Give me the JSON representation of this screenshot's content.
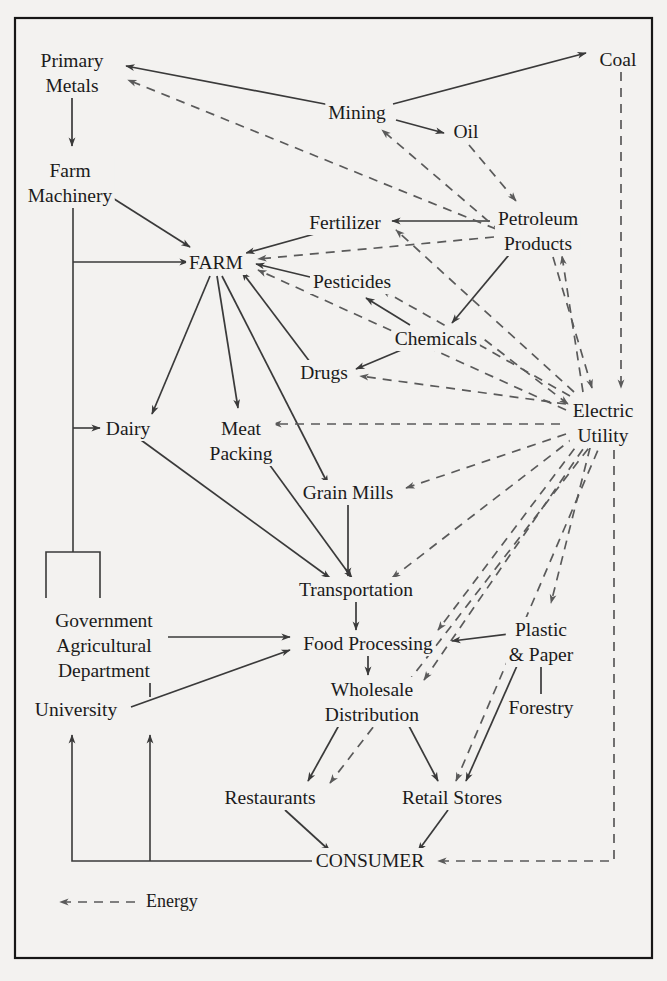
{
  "diagram": {
    "legend": {
      "label": "Energy",
      "style": "dashed-arrow"
    },
    "colors": {
      "background": "#f3f2f0",
      "ink": "#1b1b1b",
      "solid_line": "#3a3a3a",
      "dashed_line": "#5a5a5a",
      "frame": "#171717"
    },
    "nodes": [
      {
        "id": "primary_metals",
        "label_lines": [
          "Primary",
          "Metals"
        ],
        "x": 72,
        "y": 60
      },
      {
        "id": "coal",
        "label_lines": [
          "Coal"
        ],
        "x": 618,
        "y": 59
      },
      {
        "id": "mining",
        "label_lines": [
          "Mining"
        ],
        "x": 357,
        "y": 112
      },
      {
        "id": "oil",
        "label_lines": [
          "Oil"
        ],
        "x": 466,
        "y": 131
      },
      {
        "id": "farm_machinery",
        "label_lines": [
          "Farm",
          "Machinery"
        ],
        "x": 70,
        "y": 170
      },
      {
        "id": "fertilizer",
        "label_lines": [
          "Fertilizer"
        ],
        "x": 345,
        "y": 222
      },
      {
        "id": "petroleum_products",
        "label_lines": [
          "Petroleum",
          "Products"
        ],
        "x": 538,
        "y": 218
      },
      {
        "id": "farm",
        "label_lines": [
          "FARM"
        ],
        "x": 216,
        "y": 262
      },
      {
        "id": "pesticides",
        "label_lines": [
          "Pesticides"
        ],
        "x": 352,
        "y": 281
      },
      {
        "id": "chemicals",
        "label_lines": [
          "Chemicals"
        ],
        "x": 436,
        "y": 338
      },
      {
        "id": "drugs",
        "label_lines": [
          "Drugs"
        ],
        "x": 324,
        "y": 372
      },
      {
        "id": "electric_utility",
        "label_lines": [
          "Electric",
          "Utility"
        ],
        "x": 603,
        "y": 410
      },
      {
        "id": "dairy",
        "label_lines": [
          "Dairy"
        ],
        "x": 128,
        "y": 428
      },
      {
        "id": "meat_packing",
        "label_lines": [
          "Meat",
          "Packing"
        ],
        "x": 241,
        "y": 428
      },
      {
        "id": "grain_mills",
        "label_lines": [
          "Grain Mills"
        ],
        "x": 348,
        "y": 492
      },
      {
        "id": "transportation",
        "label_lines": [
          "Transportation"
        ],
        "x": 356,
        "y": 589
      },
      {
        "id": "government_ag_dept",
        "label_lines": [
          "Government",
          "Agricultural",
          "Department"
        ],
        "x": 104,
        "y": 620
      },
      {
        "id": "food_processing",
        "label_lines": [
          "Food Processing"
        ],
        "x": 368,
        "y": 643
      },
      {
        "id": "plastic_paper",
        "label_lines": [
          "Plastic",
          "& Paper"
        ],
        "x": 541,
        "y": 629
      },
      {
        "id": "forestry",
        "label_lines": [
          "Forestry"
        ],
        "x": 541,
        "y": 707
      },
      {
        "id": "university",
        "label_lines": [
          "University"
        ],
        "x": 76,
        "y": 709
      },
      {
        "id": "wholesale_distribution",
        "label_lines": [
          "Wholesale",
          "Distribution"
        ],
        "x": 372,
        "y": 689
      },
      {
        "id": "restaurants",
        "label_lines": [
          "Restaurants"
        ],
        "x": 270,
        "y": 797
      },
      {
        "id": "retail_stores",
        "label_lines": [
          "Retail Stores"
        ],
        "x": 452,
        "y": 797
      },
      {
        "id": "consumer",
        "label_lines": [
          "CONSUMER"
        ],
        "x": 370,
        "y": 860
      }
    ],
    "material_flows": [
      {
        "from": "mining",
        "to": "primary_metals"
      },
      {
        "from": "mining",
        "to": "coal"
      },
      {
        "from": "mining",
        "to": "oil"
      },
      {
        "from": "primary_metals",
        "to": "farm_machinery"
      },
      {
        "from": "farm_machinery",
        "to": "farm"
      },
      {
        "from": "petroleum_products",
        "to": "fertilizer"
      },
      {
        "from": "fertilizer",
        "to": "farm"
      },
      {
        "from": "pesticides",
        "to": "farm"
      },
      {
        "from": "chemicals",
        "to": "pesticides"
      },
      {
        "from": "chemicals",
        "to": "drugs"
      },
      {
        "from": "petroleum_products",
        "to": "chemicals"
      },
      {
        "from": "drugs",
        "to": "farm"
      },
      {
        "from": "farm",
        "to": "dairy"
      },
      {
        "from": "farm",
        "to": "meat_packing"
      },
      {
        "from": "farm",
        "to": "grain_mills"
      },
      {
        "from": "dairy",
        "to": "transportation"
      },
      {
        "from": "meat_packing",
        "to": "transportation"
      },
      {
        "from": "grain_mills",
        "to": "transportation"
      },
      {
        "from": "transportation",
        "to": "food_processing"
      },
      {
        "from": "government_ag_dept",
        "to": "food_processing"
      },
      {
        "from": "university",
        "to": "food_processing"
      },
      {
        "from": "university",
        "to": "government_ag_dept"
      },
      {
        "from": "plastic_paper",
        "to": "food_processing"
      },
      {
        "from": "forestry",
        "to": "plastic_paper"
      },
      {
        "from": "food_processing",
        "to": "wholesale_distribution"
      },
      {
        "from": "wholesale_distribution",
        "to": "restaurants"
      },
      {
        "from": "wholesale_distribution",
        "to": "retail_stores"
      },
      {
        "from": "plastic_paper",
        "to": "retail_stores"
      },
      {
        "from": "restaurants",
        "to": "consumer"
      },
      {
        "from": "retail_stores",
        "to": "consumer"
      },
      {
        "from": "consumer",
        "to": "university"
      },
      {
        "from": "consumer",
        "to": "government_ag_dept"
      },
      {
        "from": "bracket",
        "to": "farm"
      },
      {
        "from": "bracket",
        "to": "dairy"
      },
      {
        "from": "bracket",
        "to": "farm_machinery"
      }
    ],
    "energy_flows": [
      {
        "from": "petroleum_products",
        "to": "primary_metals"
      },
      {
        "from": "petroleum_products",
        "to": "mining"
      },
      {
        "from": "oil",
        "to": "petroleum_products"
      },
      {
        "from": "petroleum_products",
        "to": "farm"
      },
      {
        "from": "electric_utility",
        "to": "fertilizer_area"
      },
      {
        "from": "electric_utility",
        "to": "pesticides"
      },
      {
        "from": "electric_utility",
        "to": "drugs"
      },
      {
        "from": "electric_utility",
        "to": "farm"
      },
      {
        "from": "coal",
        "to": "electric_utility"
      },
      {
        "from": "petroleum_products",
        "to": "electric_utility"
      },
      {
        "from": "electric_utility",
        "to": "petroleum_products"
      },
      {
        "from": "chemicals",
        "to": "electric_utility"
      },
      {
        "from": "electric_utility",
        "to": "meat_packing"
      },
      {
        "from": "electric_utility",
        "to": "dairy"
      },
      {
        "from": "electric_utility",
        "to": "grain_mills"
      },
      {
        "from": "electric_utility",
        "to": "transportation"
      },
      {
        "from": "electric_utility",
        "to": "food_processing"
      },
      {
        "from": "electric_utility",
        "to": "wholesale_distribution"
      },
      {
        "from": "electric_utility",
        "to": "restaurants"
      },
      {
        "from": "electric_utility",
        "to": "retail_stores"
      },
      {
        "from": "electric_utility",
        "to": "plastic_paper"
      },
      {
        "from": "electric_utility",
        "to": "consumer"
      }
    ]
  }
}
